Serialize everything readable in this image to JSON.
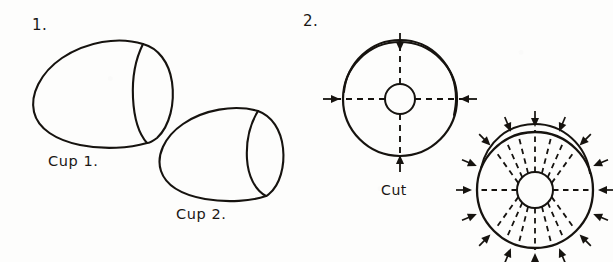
{
  "page": {
    "kind": "hand-drawn-instructional-diagram",
    "background_color": "#fdfdfc",
    "ink_color": "#16130f",
    "width": 613,
    "height": 262
  },
  "steps": [
    {
      "number_label": "1.",
      "caption": "Two cone-shaped cups drawn in perspective",
      "objects": [
        {
          "label": "Cup 1.",
          "shape": "cone-cup",
          "opening": "wide-ellipse"
        },
        {
          "label": "Cup 2.",
          "shape": "cone-cup",
          "opening": "narrow-ellipse"
        }
      ]
    },
    {
      "number_label": "2.",
      "caption": "Circular blanks marked with cut lines and inward arrows",
      "objects": [
        {
          "label": "Cut",
          "shape": "circle-with-hub",
          "cut_lines": 4,
          "arrows": 4,
          "doubled_rim": true
        },
        {
          "label": "",
          "shape": "circle-with-hub",
          "cut_lines": 16,
          "arrows": 16,
          "doubled_rim": true
        }
      ]
    }
  ],
  "labels": {
    "step_one_number": "1.",
    "step_two_number": "2.",
    "cup_one": "Cup 1.",
    "cup_two": "Cup 2.",
    "cut": "Cut"
  }
}
